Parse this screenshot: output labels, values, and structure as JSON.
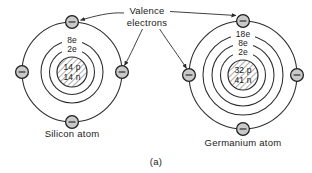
{
  "figure": {
    "label": "(a)",
    "callout": {
      "line1": "Valence",
      "line2": "electrons"
    },
    "atoms": [
      {
        "id": "silicon",
        "caption": "Silicon atom",
        "nucleus": {
          "protons": "14 p",
          "neutrons": "14 n"
        },
        "shell_labels": [
          "8e",
          "2e"
        ],
        "valence_electron_count": 4,
        "electron_symbol": "−"
      },
      {
        "id": "germanium",
        "caption": "Germanium atom",
        "nucleus": {
          "protons": "32 p",
          "neutrons": "41 n"
        },
        "shell_labels": [
          "18e",
          "8e",
          "2e"
        ],
        "valence_electron_count": 4,
        "electron_symbol": "−"
      }
    ]
  },
  "colors": {
    "background": "#ffffff",
    "ink": "#1a1a1a",
    "stroke": "#2b2b2b",
    "electron_fill": "#c9c9c9",
    "nucleus_hatch": "#8f8f8f"
  }
}
